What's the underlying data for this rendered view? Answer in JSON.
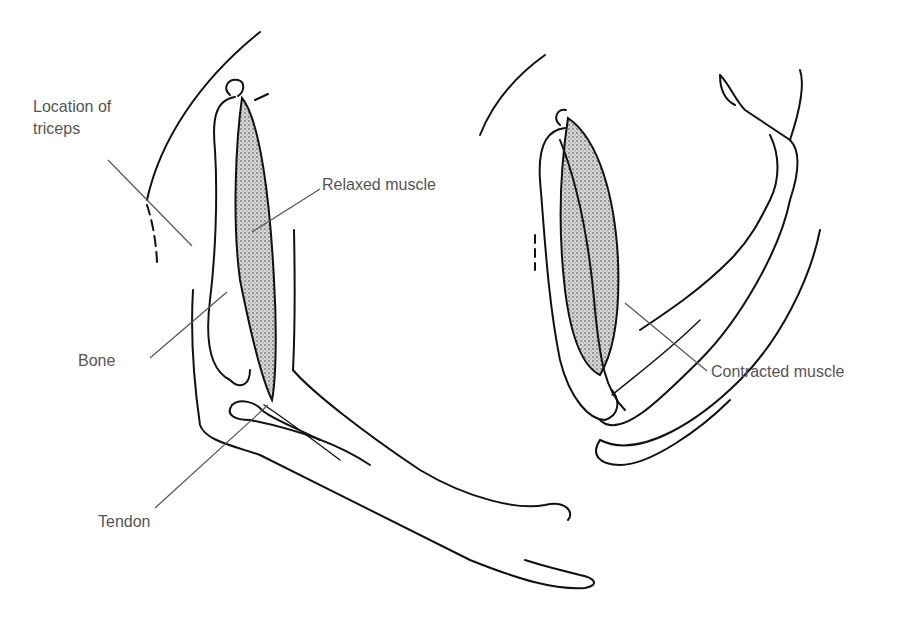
{
  "diagram": {
    "colors": {
      "ink": "#111111",
      "label": "#555555",
      "muscle": "#9a9a9a",
      "leader": "#555555"
    },
    "labels": {
      "triceps_line1": "Location of",
      "triceps_line2": "triceps",
      "relaxed": "Relaxed muscle",
      "bone": "Bone",
      "tendon": "Tendon",
      "contracted": "Contracted muscle"
    }
  }
}
